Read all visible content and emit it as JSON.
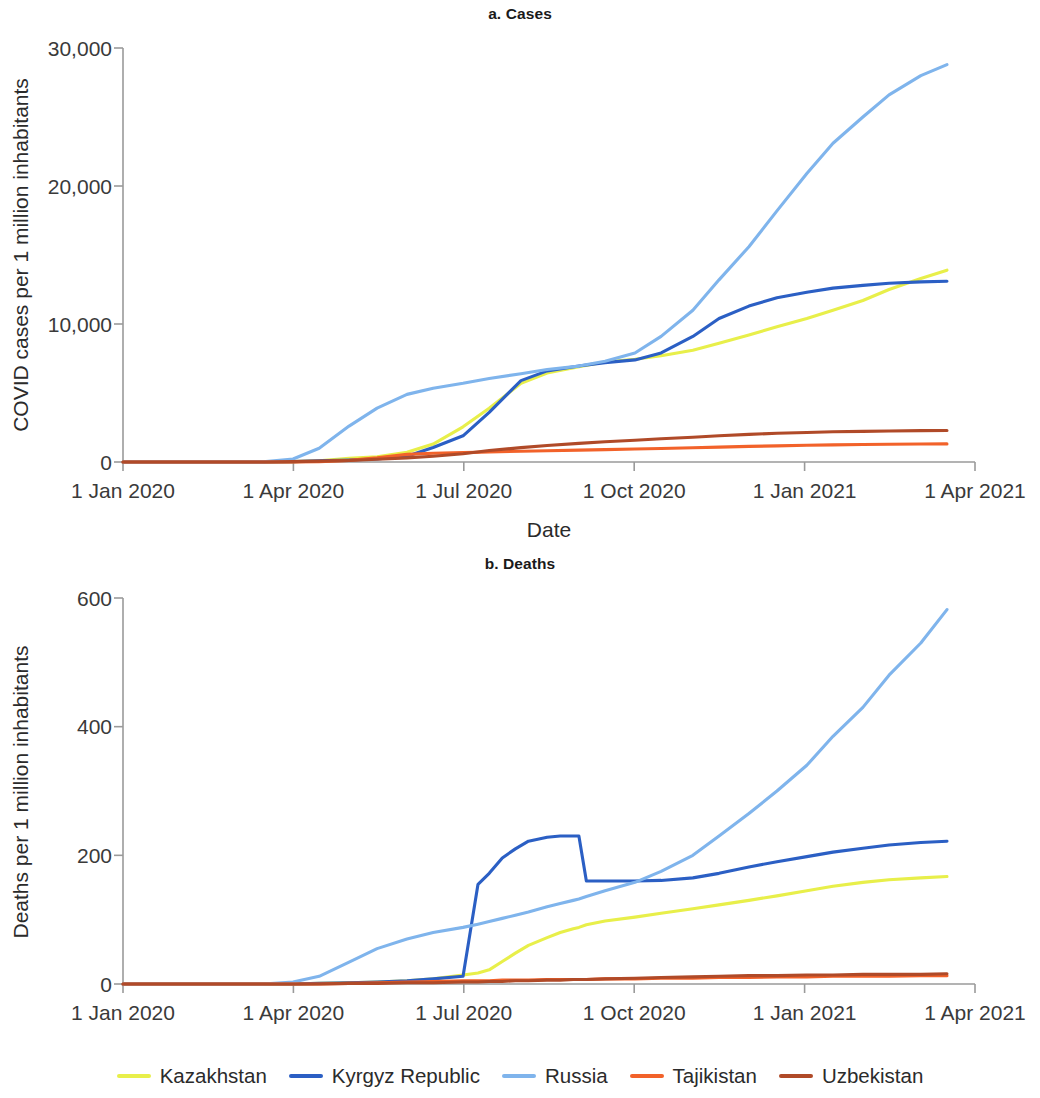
{
  "figure": {
    "legend": {
      "items": [
        {
          "label": "Kazakhstan",
          "color": "#e8ef4a"
        },
        {
          "label": "Kyrgyz Republic",
          "color": "#2b5fc4"
        },
        {
          "label": "Russia",
          "color": "#7fb4ec"
        },
        {
          "label": "Tajikistan",
          "color": "#f2622a"
        },
        {
          "label": "Uzbekistan",
          "color": "#b04a28"
        }
      ]
    }
  },
  "chart_data": [
    {
      "type": "line",
      "id": "cases",
      "title": "a. Cases",
      "xlabel": "Date",
      "ylabel": "COVID cases per 1 million inhabitants",
      "ylim": [
        0,
        30000
      ],
      "yticks": [
        0,
        10000,
        20000,
        30000
      ],
      "ytick_labels": [
        "0",
        "10,000",
        "20,000",
        "30,000"
      ],
      "xlim": [
        "1 Jan 2020",
        "1 Apr 2021"
      ],
      "xticks": [
        "1 Jan 2020",
        "1 Apr 2020",
        "1 Jul 2020",
        "1 Oct 2020",
        "1 Jan 2021",
        "1 Apr 2021"
      ],
      "grid": false,
      "legend_position": "bottom",
      "x": [
        0,
        15,
        31,
        46,
        60,
        75,
        91,
        105,
        121,
        136,
        152,
        166,
        182,
        196,
        213,
        227,
        244,
        258,
        274,
        288,
        305,
        319,
        335,
        350,
        366,
        380,
        396,
        410,
        427,
        441
      ],
      "x_labels": [
        "1 Jan 2020",
        "16 Jan 2020",
        "1 Feb 2020",
        "16 Feb 2020",
        "1 Mar 2020",
        "16 Mar 2020",
        "1 Apr 2020",
        "15 Apr 2020",
        "1 May 2020",
        "16 May 2020",
        "1 Jun 2020",
        "15 Jun 2020",
        "1 Jul 2020",
        "15 Jul 2020",
        "1 Aug 2020",
        "15 Aug 2020",
        "1 Sep 2020",
        "15 Sep 2020",
        "1 Oct 2020",
        "15 Oct 2020",
        "1 Nov 2020",
        "15 Nov 2020",
        "1 Dec 2020",
        "16 Dec 2020",
        "1 Jan 2021",
        "15 Jan 2021",
        "1 Feb 2021",
        "15 Feb 2021",
        "4 Mar 2021",
        "18 Mar 2021"
      ],
      "series": [
        {
          "name": "Kazakhstan",
          "color": "#e8ef4a",
          "values": [
            0,
            0,
            0,
            0,
            0,
            5,
            30,
            80,
            260,
            380,
            700,
            1300,
            2550,
            3900,
            5700,
            6450,
            6900,
            7250,
            7450,
            7700,
            8100,
            8600,
            9200,
            9800,
            10400,
            11000,
            11700,
            12500,
            13300,
            13900
          ]
        },
        {
          "name": "Kyrgyz Republic",
          "color": "#2b5fc4",
          "values": [
            0,
            0,
            0,
            0,
            0,
            3,
            25,
            90,
            150,
            220,
            420,
            1050,
            1900,
            3600,
            5900,
            6600,
            6950,
            7200,
            7400,
            7900,
            9100,
            10400,
            11300,
            11900,
            12300,
            12600,
            12800,
            12950,
            13050,
            13100
          ]
        },
        {
          "name": "Russia",
          "color": "#7fb4ec",
          "values": [
            0,
            0,
            0,
            0,
            1,
            10,
            220,
            1000,
            2600,
            3900,
            4900,
            5350,
            5700,
            6050,
            6400,
            6700,
            6950,
            7300,
            7900,
            9100,
            11000,
            13200,
            15600,
            18200,
            20900,
            23100,
            25000,
            26600,
            28000,
            28800
          ]
        },
        {
          "name": "Tajikistan",
          "color": "#f2622a",
          "values": [
            0,
            0,
            0,
            0,
            0,
            0,
            0,
            20,
            120,
            300,
            550,
            630,
            680,
            730,
            780,
            820,
            860,
            900,
            940,
            980,
            1030,
            1080,
            1130,
            1170,
            1210,
            1240,
            1270,
            1290,
            1300,
            1310
          ]
        },
        {
          "name": "Uzbekistan",
          "color": "#b04a28",
          "values": [
            0,
            0,
            0,
            0,
            0,
            5,
            30,
            60,
            110,
            200,
            300,
            420,
            600,
            830,
            1040,
            1200,
            1350,
            1470,
            1580,
            1680,
            1790,
            1900,
            2000,
            2080,
            2140,
            2190,
            2220,
            2250,
            2270,
            2280
          ]
        }
      ]
    },
    {
      "type": "line",
      "id": "deaths",
      "title": "b. Deaths",
      "xlabel": "Date",
      "ylabel": "Deaths  per 1 million inhabitants",
      "ylim": [
        0,
        600
      ],
      "yticks": [
        0,
        200,
        400,
        600
      ],
      "ytick_labels": [
        "0",
        "200",
        "400",
        "600"
      ],
      "xlim": [
        "1 Jan 2020",
        "1 Apr 2021"
      ],
      "xticks": [
        "1 Jan 2020",
        "1 Apr 2020",
        "1 Jul 2020",
        "1 Oct 2020",
        "1 Jan 2021",
        "1 Apr 2021"
      ],
      "grid": false,
      "legend_position": "bottom",
      "x": [
        0,
        15,
        31,
        46,
        60,
        75,
        91,
        105,
        121,
        136,
        152,
        166,
        182,
        190,
        196,
        203,
        210,
        217,
        227,
        234,
        241,
        244,
        248,
        258,
        274,
        288,
        305,
        319,
        335,
        350,
        366,
        380,
        396,
        410,
        427,
        441
      ],
      "x_labels": [
        "1 Jan 2020",
        "16 Jan 2020",
        "1 Feb 2020",
        "16 Feb 2020",
        "1 Mar 2020",
        "16 Mar 2020",
        "1 Apr 2020",
        "15 Apr 2020",
        "1 May 2020",
        "16 May 2020",
        "1 Jun 2020",
        "15 Jun 2020",
        "1 Jul 2020",
        "9 Jul 2020",
        "15 Jul 2020",
        "22 Jul 2020",
        "29 Jul 2020",
        "5 Aug 2020",
        "15 Aug 2020",
        "22 Aug 2020",
        "29 Aug 2020",
        "1 Sep 2020",
        "5 Sep 2020",
        "15 Sep 2020",
        "1 Oct 2020",
        "15 Oct 2020",
        "1 Nov 2020",
        "15 Nov 2020",
        "1 Dec 2020",
        "16 Dec 2020",
        "1 Jan 2021",
        "15 Jan 2021",
        "1 Feb 2021",
        "15 Feb 2021",
        "4 Mar 2021",
        "18 Mar 2021"
      ],
      "series": [
        {
          "name": "Kazakhstan",
          "color": "#e8ef4a",
          "values": [
            0,
            0,
            0,
            0,
            0,
            0,
            0,
            1,
            2,
            3,
            5,
            8,
            14,
            17,
            22,
            35,
            48,
            60,
            72,
            80,
            86,
            88,
            92,
            98,
            104,
            110,
            117,
            123,
            130,
            137,
            145,
            152,
            158,
            162,
            165,
            167
          ]
        },
        {
          "name": "Kyrgyz Republic",
          "color": "#2b5fc4",
          "values": [
            0,
            0,
            0,
            0,
            0,
            0,
            0,
            1,
            2,
            3,
            5,
            8,
            12,
            155,
            172,
            196,
            210,
            222,
            228,
            230,
            230,
            230,
            160,
            160,
            160,
            161,
            165,
            172,
            182,
            190,
            198,
            205,
            211,
            216,
            220,
            222
          ]
        },
        {
          "name": "Russia",
          "color": "#7fb4ec",
          "values": [
            0,
            0,
            0,
            0,
            0,
            0,
            3,
            12,
            34,
            55,
            70,
            80,
            88,
            93,
            97,
            102,
            107,
            112,
            120,
            125,
            130,
            132,
            136,
            145,
            158,
            175,
            200,
            230,
            265,
            300,
            340,
            385,
            430,
            480,
            530,
            582
          ]
        },
        {
          "name": "Tajikistan",
          "color": "#f2622a",
          "values": [
            0,
            0,
            0,
            0,
            0,
            0,
            0,
            0,
            1,
            2,
            3,
            4,
            5,
            5,
            5,
            6,
            6,
            6,
            7,
            7,
            7,
            7,
            7,
            8,
            8,
            9,
            9,
            10,
            10,
            11,
            11,
            12,
            12,
            12,
            13,
            13
          ]
        },
        {
          "name": "Uzbekistan",
          "color": "#b04a28",
          "values": [
            0,
            0,
            0,
            0,
            0,
            0,
            0,
            0,
            1,
            1,
            2,
            2,
            3,
            3,
            4,
            4,
            5,
            5,
            6,
            6,
            7,
            7,
            7,
            8,
            9,
            10,
            11,
            12,
            13,
            13,
            14,
            14,
            15,
            15,
            15,
            16
          ]
        }
      ]
    }
  ]
}
